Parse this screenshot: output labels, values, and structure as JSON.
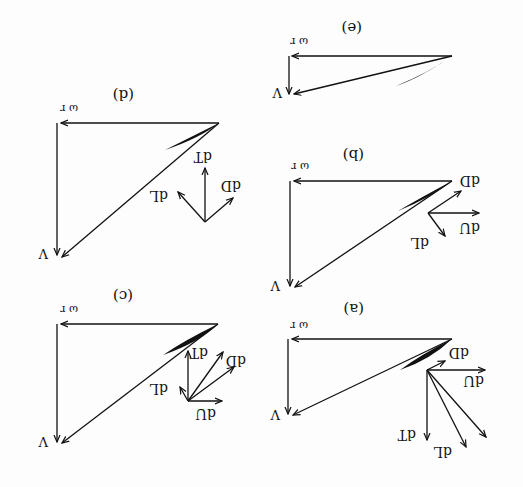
{
  "figure": {
    "orientation": "rotated 180 degrees",
    "ink_color": "#111111",
    "background": "#fdfdfd",
    "panels": [
      {
        "id": "a",
        "label": "(a)",
        "top_label": "ω r",
        "side_label": "V",
        "forces": [
          "dD",
          "dU",
          "dT",
          "dL"
        ]
      },
      {
        "id": "b",
        "label": "(b)",
        "top_label": "ω r",
        "side_label": "V",
        "forces": [
          "dD",
          "dU",
          "dL"
        ]
      },
      {
        "id": "c",
        "label": "(c)",
        "top_label": "ω r",
        "side_label": "V",
        "forces": [
          "dT",
          "dD",
          "dL",
          "dU"
        ]
      },
      {
        "id": "d",
        "label": "(d)",
        "top_label": "ω r",
        "side_label": "V",
        "forces": [
          "dT",
          "dD",
          "dL"
        ]
      },
      {
        "id": "e",
        "label": "(e)",
        "top_label": "ω r",
        "side_label": "V",
        "forces": []
      }
    ]
  }
}
